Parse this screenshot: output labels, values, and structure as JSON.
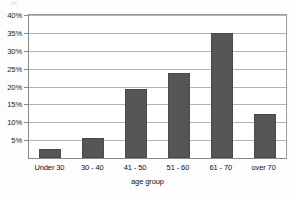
{
  "chart_data": {
    "type": "bar",
    "title": "",
    "subtitle": "",
    "xlabel": "age group",
    "ylabel": "",
    "categories": [
      "Under 30",
      "30 - 40",
      "41 - 50",
      "51 - 60",
      "61 - 70",
      "over 70"
    ],
    "values": [
      2.5,
      5.7,
      19.4,
      23.8,
      35.0,
      12.3
    ],
    "value_labels": [
      "",
      "",
      "",
      "",
      "",
      ""
    ],
    "ylim": [
      0,
      40
    ],
    "ytick_values": [
      5,
      10,
      15,
      20,
      25,
      30,
      35,
      40
    ],
    "ytick_labels": [
      "5%",
      "10%",
      "15%",
      "20%",
      "25%",
      "30%",
      "35%",
      "40%"
    ],
    "grid": true,
    "legend": false,
    "legend_position": "none",
    "orientation": "vertical",
    "bar_color": "#565656",
    "gridline_color": "#b4b4b4",
    "frame_color": "#8a8a8a",
    "background_color": "#ffffff"
  }
}
